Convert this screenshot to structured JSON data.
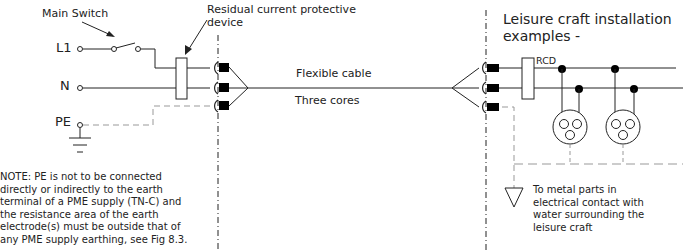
{
  "diagram": {
    "title_lines": [
      "Leisure craft installation",
      "examples -"
    ],
    "labels": {
      "main_switch": "Main Switch",
      "rcd_device_line1": "Residual current  protective",
      "rcd_device_line2": "device",
      "l1": "L1",
      "n": "N",
      "pe": "PE",
      "flexible_cable": "Flexible cable",
      "three_cores": "Three cores",
      "rcd": "RCD"
    },
    "note_lines": [
      "NOTE: PE is not to be connected",
      "directly or indirectly to the earth",
      "terminal of a PME supply (TN-C) and",
      "the resistance area of the earth",
      "electrode(s) must be outside that of",
      "any PME supply earthing, see Fig 8.3."
    ],
    "earth_text_lines": [
      "To metal parts in",
      "electrical contact with",
      "water surrounding the",
      "leisure craft"
    ],
    "colors": {
      "line": "#222222",
      "dashed_earth": "#999999",
      "connector_fill": "#000000"
    }
  }
}
